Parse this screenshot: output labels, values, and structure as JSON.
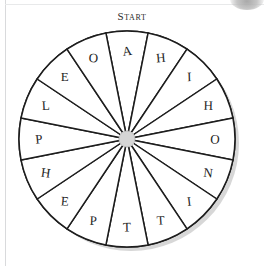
{
  "page": {
    "background_color": "#ffffff",
    "frame_color": "#d9dadc"
  },
  "header": {
    "start_label": "Start"
  },
  "wheel": {
    "name": "spinner-wheel",
    "sector_count": 16,
    "sector_angle_degrees": 22.5,
    "outline_color": "#1d1d1d",
    "sector_fill": "#ffffff",
    "hub_color": "#d5d5d5",
    "hub_outline_color": "#bdbdbd",
    "shadow_color": "#c9c9c9",
    "letters": [
      "A",
      "H",
      "I",
      "H",
      "O",
      "N",
      "I",
      "T",
      "T",
      "P",
      "E",
      "H",
      "P",
      "L",
      "E",
      "O"
    ],
    "sectors": [
      {
        "letter": "A",
        "center_angle": -90
      },
      {
        "letter": "H",
        "center_angle": -67.5
      },
      {
        "letter": "I",
        "center_angle": -45
      },
      {
        "letter": "H",
        "center_angle": -22.5
      },
      {
        "letter": "O",
        "center_angle": 0
      },
      {
        "letter": "N",
        "center_angle": 22.5
      },
      {
        "letter": "I",
        "center_angle": 45
      },
      {
        "letter": "T",
        "center_angle": 67.5
      },
      {
        "letter": "T",
        "center_angle": 90
      },
      {
        "letter": "P",
        "center_angle": 112.5
      },
      {
        "letter": "E",
        "center_angle": 135
      },
      {
        "letter": "H",
        "center_angle": 157.5
      },
      {
        "letter": "P",
        "center_angle": 180
      },
      {
        "letter": "L",
        "center_angle": 202.5
      },
      {
        "letter": "E",
        "center_angle": 225
      },
      {
        "letter": "O",
        "center_angle": 247.5
      }
    ]
  },
  "chart_data": {
    "type": "pie",
    "title": "Start",
    "categories": [
      "A",
      "H",
      "I",
      "H",
      "O",
      "N",
      "I",
      "T",
      "T",
      "P",
      "E",
      "H",
      "P",
      "L",
      "E",
      "O"
    ],
    "values": [
      22.5,
      22.5,
      22.5,
      22.5,
      22.5,
      22.5,
      22.5,
      22.5,
      22.5,
      22.5,
      22.5,
      22.5,
      22.5,
      22.5,
      22.5,
      22.5
    ],
    "xlabel": "",
    "ylabel": "",
    "legend": "none",
    "grid": false
  }
}
